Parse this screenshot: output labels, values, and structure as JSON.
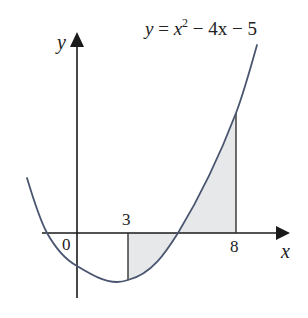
{
  "figure": {
    "kind": "function-graph-with-shaded-region",
    "drawn_to_scale": false,
    "equation": {
      "lhs": "y",
      "equals": " = ",
      "base": "x",
      "exponent": "2",
      "rest": " − 4x − 5",
      "full_text": "y = x² − 4x − 5"
    },
    "axes": {
      "x_label": "x",
      "y_label": "y",
      "origin_label": "0"
    },
    "annotations": {
      "left_bound_label": "3",
      "right_bound_label": "8"
    },
    "math": {
      "function": "x^2 - 4x - 5",
      "coefficients": {
        "a": 1,
        "b": -4,
        "c": -5
      },
      "roots": [
        -1,
        5
      ],
      "y_intercept": -5,
      "vertex": {
        "x": 2,
        "y": -9
      },
      "shaded_interval": [
        3,
        8
      ],
      "shaded_region_note": "Region between curve and x-axis from x=3 to x=8; below axis on [3,5], above axis on [5,8]"
    },
    "colors": {
      "curve": "#4a5570",
      "axes": "#1a1a1a",
      "shading": "#e6e8ea",
      "bound_lines": "#333333",
      "text": "#222222",
      "background": "#ffffff"
    }
  }
}
